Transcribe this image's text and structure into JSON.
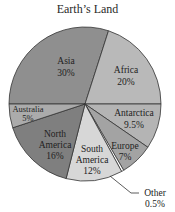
{
  "chart_data": {
    "type": "pie",
    "title": "Earth’s Land",
    "start_angle_deg": 180,
    "direction": "clockwise",
    "slices": [
      {
        "label": "Asia",
        "value": 30,
        "display": "30%",
        "color": "#8f8f8f"
      },
      {
        "label": "Africa",
        "value": 20,
        "display": "20%",
        "color": "#b9b9b9"
      },
      {
        "label": "Antarctica",
        "value": 9.5,
        "display": "9.5%",
        "color": "#b4b4b4"
      },
      {
        "label": "Europe",
        "value": 7,
        "display": "7%",
        "color": "#a3a3a3"
      },
      {
        "label": "Other",
        "value": 0.5,
        "display": "0.5%",
        "color": "#ffffff"
      },
      {
        "label": "South America",
        "value": 12,
        "display": "12%",
        "color": "#d7d7d7"
      },
      {
        "label": "North America",
        "value": 16,
        "display": "16%",
        "color": "#7f7f7f"
      },
      {
        "label": "Australia",
        "value": 5,
        "display": "5%",
        "color": "#ababab"
      }
    ],
    "labels": {
      "asia": [
        "Asia",
        "30%"
      ],
      "africa": [
        "Africa",
        "20%"
      ],
      "antarctica": [
        "Antarctica",
        "9.5%"
      ],
      "europe": [
        "Europe",
        "7%"
      ],
      "other": [
        "Other",
        "0.5%"
      ],
      "south_america": [
        "South",
        "America",
        "12%"
      ],
      "north_america": [
        "North",
        "America",
        "16%"
      ],
      "australia": [
        "Australia",
        "5%"
      ]
    }
  }
}
